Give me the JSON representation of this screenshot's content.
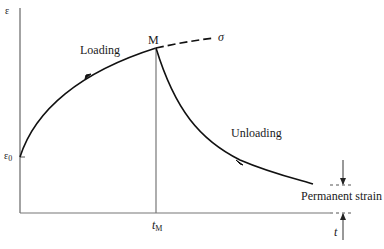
{
  "diagram": {
    "type": "creep strain-time curve",
    "axes": {
      "y_label": "ε",
      "x_label": "t"
    },
    "labels": {
      "loading": "Loading",
      "unloading": "Unloading",
      "max_point": "M",
      "stress_continuation": "σ",
      "initial_strain": "ε",
      "initial_strain_sub": "0",
      "time_at_max": "t",
      "time_at_max_sub": "M",
      "permanent_strain": "Permanent strain"
    },
    "colors": {
      "curve": "#111111",
      "axis": "#555555",
      "background": "#ffffff"
    }
  }
}
